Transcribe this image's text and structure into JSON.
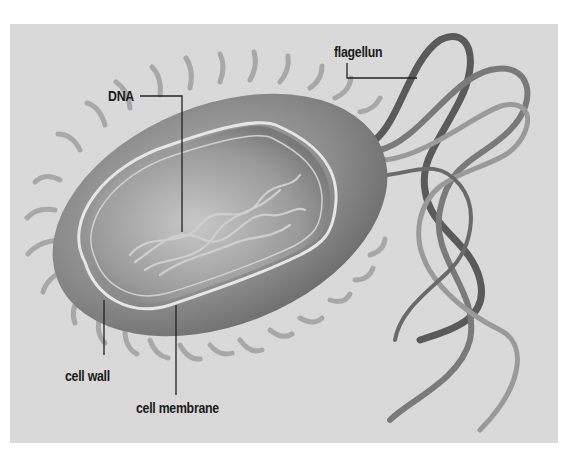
{
  "diagram": {
    "colors": {
      "background": "#ffffff",
      "panel": "#d9d9d9",
      "cell_body": "#8c8c8c",
      "interior": "#b5b5b5",
      "wall_outline": "#e6e6e6",
      "flagella": "#6b6b6b",
      "pili": "#a8a8a8",
      "leader_lines": "#222222",
      "label_text": "#1a1a1a"
    },
    "labels": {
      "flagellum": "flagellun",
      "dna": "DNA",
      "cell_wall": "cell wall",
      "cell_membrane": "cell membrane"
    }
  }
}
